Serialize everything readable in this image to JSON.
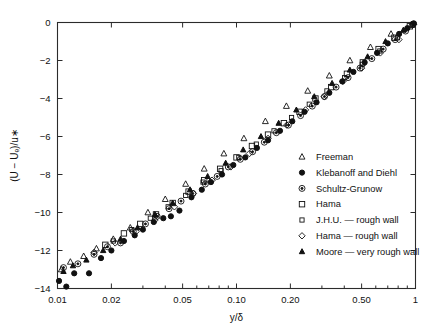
{
  "chart_data": {
    "type": "scatter",
    "title": "",
    "xlabel": "y/δ",
    "ylabel": "(U − Uₑ)/u∗",
    "xscale": "log",
    "yscale": "linear",
    "xlim": [
      0.01,
      1.0
    ],
    "ylim": [
      -14,
      0
    ],
    "grid": false,
    "xticks": [
      0.01,
      0.02,
      0.05,
      0.1,
      0.2,
      0.5,
      1.0
    ],
    "xticklabels": [
      "0.01",
      "0.02",
      "0.05",
      "0.10",
      "0.20",
      "0.50",
      "1"
    ],
    "yticks": [
      0,
      -2,
      -4,
      -6,
      -8,
      -10,
      -12,
      -14
    ],
    "yticklabels": [
      "0",
      "−2",
      "−4",
      "−6",
      "−8",
      "−10",
      "−12",
      "−14"
    ],
    "legend_position": "right",
    "series": [
      {
        "name": "Freeman",
        "marker": "open-triangle",
        "points": [
          [
            0.0105,
            -13.0
          ],
          [
            0.0118,
            -12.6
          ],
          [
            0.014,
            -12.3
          ],
          [
            0.0165,
            -11.9
          ],
          [
            0.0205,
            -11.4
          ],
          [
            0.0255,
            -10.8
          ],
          [
            0.032,
            -10.0
          ],
          [
            0.04,
            -9.3
          ],
          [
            0.052,
            -8.5
          ],
          [
            0.066,
            -7.7
          ],
          [
            0.085,
            -6.9
          ],
          [
            0.11,
            -6.1
          ],
          [
            0.145,
            -5.2
          ],
          [
            0.19,
            -4.4
          ],
          [
            0.25,
            -3.6
          ],
          [
            0.33,
            -2.8
          ],
          [
            0.43,
            -2.0
          ],
          [
            0.56,
            -1.3
          ],
          [
            0.73,
            -0.6
          ],
          [
            0.95,
            -0.1
          ]
        ]
      },
      {
        "name": "Klebanoff and Diehl",
        "marker": "filled-circle",
        "points": [
          [
            0.0102,
            -13.6
          ],
          [
            0.0112,
            -13.9
          ],
          [
            0.0124,
            -13.2
          ],
          [
            0.015,
            -13.2
          ],
          [
            0.0175,
            -12.4
          ],
          [
            0.02,
            -12.0
          ],
          [
            0.0235,
            -11.5
          ],
          [
            0.027,
            -11.2
          ],
          [
            0.03,
            -10.9
          ],
          [
            0.0345,
            -10.5
          ],
          [
            0.039,
            -10.3
          ],
          [
            0.043,
            -10.2
          ],
          [
            0.048,
            -9.9
          ],
          [
            0.056,
            -9.2
          ],
          [
            0.064,
            -8.8
          ],
          [
            0.072,
            -8.4
          ],
          [
            0.083,
            -8.0
          ],
          [
            0.096,
            -7.5
          ],
          [
            0.112,
            -7.1
          ],
          [
            0.13,
            -6.6
          ],
          [
            0.15,
            -6.2
          ],
          [
            0.175,
            -5.7
          ],
          [
            0.205,
            -5.2
          ],
          [
            0.24,
            -4.7
          ],
          [
            0.28,
            -4.2
          ],
          [
            0.33,
            -3.7
          ],
          [
            0.39,
            -3.1
          ],
          [
            0.45,
            -2.6
          ],
          [
            0.52,
            -2.1
          ],
          [
            0.61,
            -1.6
          ],
          [
            0.7,
            -1.1
          ],
          [
            0.81,
            -0.6
          ],
          [
            0.9,
            -0.3
          ],
          [
            0.98,
            -0.05
          ]
        ]
      },
      {
        "name": "Schultz-Grunow",
        "marker": "dotted-circle",
        "points": [
          [
            0.0108,
            -12.9
          ],
          [
            0.013,
            -12.7
          ],
          [
            0.016,
            -12.2
          ],
          [
            0.019,
            -11.8
          ],
          [
            0.0225,
            -11.6
          ],
          [
            0.0265,
            -11.0
          ],
          [
            0.031,
            -10.6
          ],
          [
            0.036,
            -10.2
          ],
          [
            0.042,
            -9.8
          ],
          [
            0.049,
            -9.4
          ],
          [
            0.057,
            -9.0
          ],
          [
            0.067,
            -8.5
          ],
          [
            0.078,
            -8.1
          ],
          [
            0.09,
            -7.6
          ],
          [
            0.105,
            -7.2
          ],
          [
            0.123,
            -6.8
          ],
          [
            0.143,
            -6.3
          ],
          [
            0.167,
            -5.8
          ],
          [
            0.195,
            -5.4
          ],
          [
            0.228,
            -4.9
          ],
          [
            0.265,
            -4.4
          ],
          [
            0.31,
            -3.9
          ],
          [
            0.36,
            -3.4
          ],
          [
            0.42,
            -2.9
          ],
          [
            0.49,
            -2.4
          ],
          [
            0.57,
            -1.9
          ],
          [
            0.66,
            -1.4
          ],
          [
            0.77,
            -0.9
          ],
          [
            0.88,
            -0.45
          ],
          [
            0.97,
            -0.08
          ]
        ]
      },
      {
        "name": "Hama",
        "marker": "open-square",
        "points": [
          [
            0.0185,
            -11.7
          ],
          [
            0.0235,
            -11.1
          ],
          [
            0.029,
            -10.6
          ],
          [
            0.0355,
            -10.1
          ],
          [
            0.044,
            -9.5
          ],
          [
            0.054,
            -8.9
          ],
          [
            0.066,
            -8.3
          ],
          [
            0.081,
            -7.7
          ],
          [
            0.1,
            -7.1
          ],
          [
            0.122,
            -6.5
          ],
          [
            0.15,
            -5.9
          ],
          [
            0.184,
            -5.3
          ],
          [
            0.225,
            -4.7
          ],
          [
            0.276,
            -4.0
          ],
          [
            0.338,
            -3.4
          ],
          [
            0.414,
            -2.7
          ],
          [
            0.508,
            -2.1
          ],
          [
            0.622,
            -1.4
          ],
          [
            0.762,
            -0.8
          ],
          [
            0.93,
            -0.2
          ]
        ]
      },
      {
        "name": "J.H.U. — rough wall",
        "marker": "small-open-square",
        "points": [
          [
            0.0205,
            -11.5
          ],
          [
            0.026,
            -10.9
          ],
          [
            0.033,
            -10.3
          ],
          [
            0.0415,
            -9.7
          ],
          [
            0.052,
            -9.1
          ],
          [
            0.065,
            -8.4
          ],
          [
            0.082,
            -7.8
          ],
          [
            0.103,
            -7.1
          ],
          [
            0.129,
            -6.4
          ],
          [
            0.162,
            -5.7
          ],
          [
            0.203,
            -5.0
          ],
          [
            0.255,
            -4.3
          ],
          [
            0.32,
            -3.6
          ],
          [
            0.402,
            -2.9
          ],
          [
            0.504,
            -2.2
          ],
          [
            0.632,
            -1.5
          ],
          [
            0.793,
            -0.8
          ],
          [
            0.96,
            -0.15
          ]
        ]
      },
      {
        "name": "Hama — rough wall",
        "marker": "open-diamond",
        "points": [
          [
            0.016,
            -12.1
          ],
          [
            0.021,
            -11.6
          ],
          [
            0.0275,
            -11.0
          ],
          [
            0.035,
            -10.4
          ],
          [
            0.045,
            -9.7
          ],
          [
            0.0575,
            -9.0
          ],
          [
            0.073,
            -8.3
          ],
          [
            0.093,
            -7.6
          ],
          [
            0.118,
            -6.9
          ],
          [
            0.15,
            -6.1
          ],
          [
            0.191,
            -5.4
          ],
          [
            0.243,
            -4.6
          ],
          [
            0.309,
            -3.9
          ],
          [
            0.393,
            -3.1
          ],
          [
            0.5,
            -2.4
          ],
          [
            0.636,
            -1.6
          ],
          [
            0.808,
            -0.9
          ],
          [
            0.975,
            -0.1
          ]
        ]
      },
      {
        "name": "Moore — very rough wall",
        "marker": "small-triangle",
        "points": [
          [
            0.0108,
            -13.1
          ],
          [
            0.0122,
            -12.8
          ],
          [
            0.0145,
            -12.5
          ],
          [
            0.018,
            -12.0
          ],
          [
            0.0225,
            -11.4
          ],
          [
            0.028,
            -10.8
          ],
          [
            0.035,
            -10.1
          ],
          [
            0.044,
            -9.5
          ],
          [
            0.055,
            -8.8
          ],
          [
            0.069,
            -8.1
          ],
          [
            0.087,
            -7.4
          ],
          [
            0.109,
            -6.7
          ],
          [
            0.137,
            -6.0
          ],
          [
            0.172,
            -5.3
          ],
          [
            0.216,
            -4.6
          ],
          [
            0.272,
            -3.9
          ],
          [
            0.342,
            -3.2
          ],
          [
            0.43,
            -2.5
          ],
          [
            0.54,
            -1.8
          ],
          [
            0.68,
            -1.0
          ],
          [
            0.855,
            -0.4
          ]
        ]
      }
    ]
  },
  "legend": {
    "items": [
      {
        "label": "Freeman",
        "marker": "open-triangle"
      },
      {
        "label": "Klebanoff and Diehl",
        "marker": "filled-circle"
      },
      {
        "label": "Schultz-Grunow",
        "marker": "dotted-circle"
      },
      {
        "label": "Hama",
        "marker": "open-square"
      },
      {
        "label": "J.H.U. — rough wall",
        "marker": "small-open-square"
      },
      {
        "label": "Hama — rough wall",
        "marker": "open-diamond"
      },
      {
        "label": "Moore — very rough wall",
        "marker": "small-triangle"
      }
    ]
  }
}
